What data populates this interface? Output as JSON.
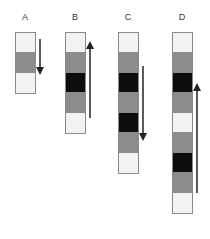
{
  "colors": {
    "light": "#f2f2f2",
    "gray": "#8c8c8c",
    "black": "#0d0d0d",
    "border": "#8a8a8a",
    "arrow": "#222222"
  },
  "columns": [
    {
      "label": "A",
      "cells": [
        "light",
        "gray",
        "light"
      ],
      "arrow": "down",
      "left": 15,
      "arrow_top": 39,
      "arrow_bottom": 75
    },
    {
      "label": "B",
      "cells": [
        "light",
        "gray",
        "black",
        "gray",
        "light"
      ],
      "arrow": "up",
      "left": 65,
      "arrow_top": 42,
      "arrow_bottom": 118
    },
    {
      "label": "C",
      "cells": [
        "light",
        "gray",
        "black",
        "gray",
        "black",
        "gray",
        "light"
      ],
      "arrow": "down",
      "left": 118,
      "arrow_top": 66,
      "arrow_bottom": 141
    },
    {
      "label": "D",
      "cells": [
        "light",
        "gray",
        "black",
        "gray",
        "light",
        "gray",
        "black",
        "gray",
        "light"
      ],
      "arrow": "up",
      "left": 172,
      "arrow_top": 84,
      "arrow_bottom": 193
    }
  ]
}
